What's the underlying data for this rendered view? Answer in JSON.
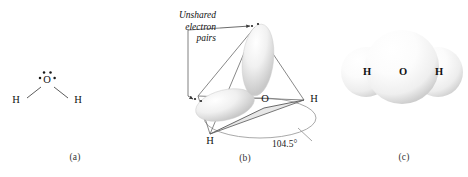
{
  "figure": {
    "background_color": "#ffffff",
    "width": 468,
    "height": 177
  },
  "panel_a": {
    "caption": "(a)",
    "type": "lewis-structure",
    "atoms": [
      {
        "symbol": "O",
        "role": "central",
        "x": 47,
        "y": 80
      },
      {
        "symbol": "H",
        "role": "left",
        "x": 16,
        "y": 100
      },
      {
        "symbol": "H",
        "role": "right",
        "x": 78,
        "y": 100
      }
    ],
    "lone_pair_count": 2,
    "bond_count": 2
  },
  "panel_b": {
    "caption": "(b)",
    "type": "tetrahedral-orbital-geometry",
    "annotation": {
      "line1": "Unshared",
      "line2": "electron",
      "line3": "pairs"
    },
    "bond_angle": "104.5°",
    "atoms": [
      {
        "symbol": "O",
        "role": "central"
      },
      {
        "symbol": "H",
        "role": "right"
      },
      {
        "symbol": "H",
        "role": "front"
      }
    ],
    "lobe_count": 2
  },
  "panel_c": {
    "caption": "(c)",
    "type": "space-filling-model",
    "atoms": [
      {
        "symbol": "H",
        "role": "left"
      },
      {
        "symbol": "O",
        "role": "central"
      },
      {
        "symbol": "H",
        "role": "right"
      }
    ]
  },
  "colors": {
    "stroke": "#6f6f6f",
    "dark_stroke": "#3a3a3a",
    "sphere_light": "#ffffff",
    "sphere_shade": "#d3d3d3",
    "lobe_shade": "#e2e2e2",
    "text": "#111111"
  }
}
